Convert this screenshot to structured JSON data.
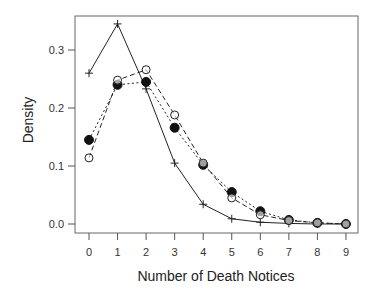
{
  "chart_data": {
    "type": "line",
    "title": "",
    "xlabel": "Number of Death Notices",
    "ylabel": "Density",
    "x": [
      0,
      1,
      2,
      3,
      4,
      5,
      6,
      7,
      8,
      9
    ],
    "xticks": [
      "0",
      "1",
      "2",
      "3",
      "4",
      "5",
      "6",
      "7",
      "8",
      "9"
    ],
    "yticks": [
      "0.0",
      "0.1",
      "0.2",
      "0.3"
    ],
    "ylim": [
      0,
      0.36
    ],
    "grid": false,
    "legend": null,
    "series": [
      {
        "name": "cross-solid",
        "marker": "cross",
        "line": "solid",
        "values": [
          0.26,
          0.345,
          0.233,
          0.105,
          0.034,
          0.009,
          0.003,
          0.001,
          0.0,
          0.0
        ]
      },
      {
        "name": "filled-circle-dotted",
        "marker": "filled-circle",
        "line": "dotted",
        "values": [
          0.145,
          0.24,
          0.245,
          0.166,
          0.102,
          0.055,
          0.022,
          0.007,
          0.002,
          0.0
        ]
      },
      {
        "name": "open-circle-dashed",
        "marker": "open-circle",
        "line": "dashed",
        "values": [
          0.114,
          0.248,
          0.266,
          0.188,
          0.105,
          0.045,
          0.016,
          0.006,
          0.002,
          0.0
        ]
      }
    ]
  },
  "colors": {
    "line": "#222222",
    "axis": "#555555"
  }
}
